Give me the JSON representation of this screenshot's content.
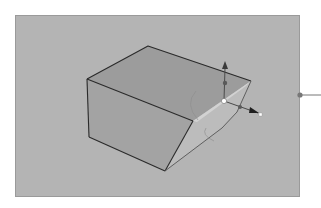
{
  "viewport": {
    "label": "3D viewport",
    "background_color": "#b4b4b4",
    "border_color": "#9a9a9a"
  },
  "object": {
    "label": "Box with beveled edge",
    "faces": {
      "top_color": "#9c9c9c",
      "front_color": "#a2a2a2",
      "bevel_color": "#bdbdbd",
      "bevel_highlight_color": "#d4d4d4",
      "edge_color": "#2a2a2a"
    }
  },
  "gizmo": {
    "label": "Transform manipulator",
    "center_handle_color": "#ffffff",
    "axis_color": "#3a3a3a",
    "arc_color": "#8e8e8e",
    "axes": [
      {
        "name": "Y axis",
        "direction": "up"
      },
      {
        "name": "X axis",
        "direction": "right"
      }
    ]
  },
  "connector": {
    "label": "Callout connector",
    "dot_color": "#777777",
    "line_color": "#777777"
  }
}
